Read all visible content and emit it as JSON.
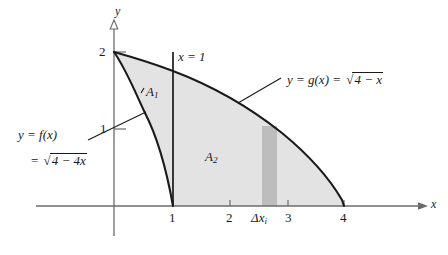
{
  "figure": {
    "axes": {
      "x_axis_label": "x",
      "y_axis_label": "y",
      "x_ticks": [
        "1",
        "2",
        "3",
        "4"
      ],
      "y_ticks": [
        "1",
        "2"
      ]
    },
    "curves": {
      "f": {
        "label_line1": "y = f(x)",
        "label_line2_prefix": "=",
        "label_line2_radicand": "4 − 4x",
        "radical_symbol": "√"
      },
      "g": {
        "label_prefix": "y = g(x) =",
        "label_radicand": "4 − x",
        "radical_symbol": "√"
      }
    },
    "vertical_line_label": "x = 1",
    "regions": {
      "a1_label": "A",
      "a1_sub": "1",
      "a2_label": "A",
      "a2_sub": "2"
    },
    "strip": {
      "label_delta": "Δx",
      "label_sub": "i"
    },
    "colors": {
      "region_fill": "#e3e3e3",
      "strip_fill": "#bdbdbd",
      "curve_stroke": "#1a1a1a",
      "axis_stroke": "#6b6b6b",
      "background": "#ffffff"
    }
  }
}
